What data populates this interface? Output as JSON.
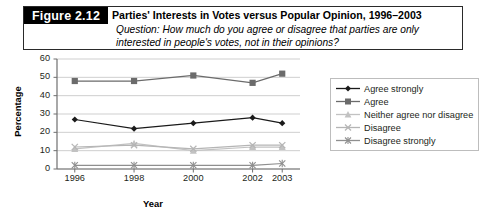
{
  "caption": {
    "tag": "Figure 2.12",
    "title": "Parties' Interests in Votes versus Popular Opinion, 1996–2003",
    "question_line1": "Question: How much do you agree or disagree that parties are only",
    "question_line2": "interested in people's votes, not in their opinions?"
  },
  "chart_data": {
    "type": "line",
    "title": "Parties' Interests in Votes versus Popular Opinion, 1996–2003",
    "xlabel": "Year",
    "ylabel": "Percentage",
    "categories": [
      "1996",
      "1998",
      "2000",
      "2002",
      "2003"
    ],
    "x": [
      1996,
      1998,
      2000,
      2002,
      2003
    ],
    "xlim": [
      1995.4,
      2003.6
    ],
    "ylim": [
      0,
      60
    ],
    "yticks": [
      "0",
      "10",
      "20",
      "30",
      "40",
      "50",
      "60"
    ],
    "grid": true,
    "legend_position": "right",
    "series": [
      {
        "name": "Agree strongly",
        "marker": "diamond",
        "color": "#1a1a1a",
        "values": [
          27,
          22,
          25,
          28,
          25
        ]
      },
      {
        "name": "Agree",
        "marker": "square",
        "color": "#6b6b6b",
        "values": [
          48,
          48,
          51,
          47,
          52
        ]
      },
      {
        "name": "Neither agree nor disagree",
        "marker": "triangle",
        "color": "#c2c2c2",
        "values": [
          11,
          14,
          10,
          12,
          12
        ]
      },
      {
        "name": "Disagree",
        "marker": "x",
        "color": "#b5b5b5",
        "values": [
          12,
          13,
          11,
          13,
          13
        ]
      },
      {
        "name": "Disagree strongly",
        "marker": "asterisk",
        "color": "#8f8f8f",
        "values": [
          2,
          2,
          2,
          2,
          3
        ]
      }
    ]
  },
  "colors": {
    "axis": "#6f6f6f",
    "grid": "#c9c9c9",
    "caption_tag_bg": "#000000",
    "caption_border": "#2a2a2a"
  }
}
